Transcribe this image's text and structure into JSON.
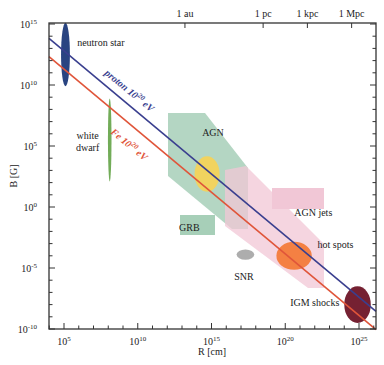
{
  "chart_data": {
    "type": "scatter",
    "title": "",
    "xlabel": "R [cm]",
    "ylabel": "B [G]",
    "xscale": "log",
    "yscale": "log",
    "xlim_exp": [
      4,
      26
    ],
    "ylim_exp": [
      -10.5,
      15.2
    ],
    "x_ticks": [
      {
        "exp": 5,
        "label": "10",
        "sup": "5"
      },
      {
        "exp": 10,
        "label": "10",
        "sup": "10"
      },
      {
        "exp": 15,
        "label": "10",
        "sup": "15"
      },
      {
        "exp": 20,
        "label": "10",
        "sup": "20"
      },
      {
        "exp": 25,
        "label": "10",
        "sup": "25"
      }
    ],
    "y_ticks": [
      {
        "exp": 15,
        "label": "10",
        "sup": "15"
      },
      {
        "exp": 10,
        "label": "10",
        "sup": "10"
      },
      {
        "exp": 5,
        "label": "10",
        "sup": "5"
      },
      {
        "exp": 0,
        "label": "10",
        "sup": "0"
      },
      {
        "exp": -5,
        "label": "10",
        "sup": "-5"
      },
      {
        "exp": -10,
        "label": "10",
        "sup": "-10"
      }
    ],
    "top_axis_ticks": [
      {
        "label": "1 au",
        "log_cm": 13.2
      },
      {
        "label": "1 pc",
        "log_cm": 18.5
      },
      {
        "label": "1 kpc",
        "log_cm": 21.5
      },
      {
        "label": "1 Mpc",
        "log_cm": 24.5
      }
    ],
    "series": [
      {
        "name": "proton 10^20 eV",
        "label_main": "proton 10",
        "label_sup": "20",
        "label_unit": " eV",
        "color": "#3a3f8f",
        "points": [
          [
            4,
            13.8
          ],
          [
            26,
            -8.4
          ]
        ]
      },
      {
        "name": "Fe 10^20 eV",
        "label_main": "Fe 10",
        "label_sup": "20",
        "label_unit": " eV",
        "color": "#e0553a",
        "points": [
          [
            4,
            12.3
          ],
          [
            26,
            -9.9
          ]
        ]
      }
    ],
    "regions": [
      {
        "name": "neutron star",
        "shape": "ellipse",
        "cx": 5.1,
        "cy": 12.5,
        "rx": 0.3,
        "ry": 2.6,
        "color": "#1e3a7a",
        "label": "neutron star",
        "label_pos": [
          7.5,
          13.2
        ]
      },
      {
        "name": "white dwarf",
        "shape": "ellipse",
        "cx": 8.1,
        "cy": 5.5,
        "rx": 0.12,
        "ry": 3.4,
        "color": "#6aa84f",
        "label_lines": [
          "white",
          "dwarf"
        ],
        "label_pos": [
          6.6,
          5.6
        ]
      },
      {
        "name": "GRB",
        "shape": "band",
        "color": "#a7cfb8",
        "label": "GRB",
        "label_pos": [
          13.5,
          -2.0
        ]
      },
      {
        "name": "AGN",
        "shape": "ellipse",
        "cx": 14.7,
        "cy": 2.7,
        "rx": 0.85,
        "ry": 1.45,
        "color": "#f7d354",
        "label": "AGN",
        "label_pos": [
          15.1,
          5.8
        ]
      },
      {
        "name": "AGN jets",
        "shape": "band",
        "color": "#f1c7d6",
        "label": "AGN jets",
        "label_pos": [
          21.9,
          -0.7
        ]
      },
      {
        "name": "SNR",
        "shape": "ellipse",
        "cx": 17.3,
        "cy": -3.9,
        "rx": 0.6,
        "ry": 0.42,
        "color": "#a9a9a9",
        "label": "SNR",
        "label_pos": [
          17.2,
          -6.0
        ]
      },
      {
        "name": "hot spots",
        "shape": "ellipse",
        "cx": 20.6,
        "cy": -4.0,
        "rx": 1.2,
        "ry": 1.15,
        "color": "#f37b3a",
        "label": "hot spots",
        "label_pos": [
          23.4,
          -3.4
        ]
      },
      {
        "name": "IGM shocks",
        "shape": "ellipse",
        "cx": 24.9,
        "cy": -8.0,
        "rx": 0.9,
        "ry": 1.5,
        "color": "#6e1527",
        "label": "IGM shocks",
        "label_pos": [
          22.0,
          -8.1
        ]
      }
    ],
    "grid": false,
    "legend": "none"
  }
}
